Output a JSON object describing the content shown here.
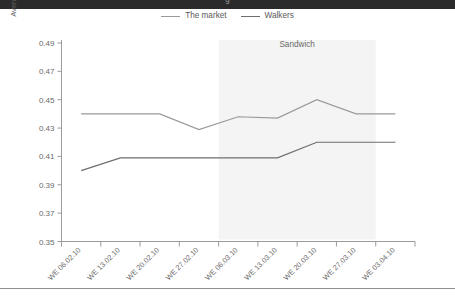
{
  "top_band": {
    "caption_fragment": "g"
  },
  "legend": {
    "position": "top-center",
    "entries": [
      {
        "label": "The market",
        "color": "#9a9a9a",
        "icon": "line-swatch-icon"
      },
      {
        "label": "Walkers",
        "color": "#6e6e6e",
        "icon": "line-swatch-icon"
      }
    ]
  },
  "annotations": [
    {
      "label": "Sandwich",
      "x_from": "WE 06.03.10",
      "x_to": "WE 27.03.10",
      "band_color": "#f4f4f4"
    }
  ],
  "axes": {
    "y_title": "Average price per single pack unit (£)",
    "y_ticks": [
      "0.35",
      "0.37",
      "0.39",
      "0.41",
      "0.43",
      "0.45",
      "0.47",
      "0.49"
    ],
    "x_ticks": [
      "WE 06.02.10",
      "WE 13.02.10",
      "WE 20.02.10",
      "WE 27.02.10",
      "WE 06.03.10",
      "WE 13.03.10",
      "WE 20.03.10",
      "WE 27.03.10",
      "WE 03.04.10"
    ]
  },
  "chart_data": {
    "type": "line",
    "title": "",
    "subtitle": "",
    "xlabel": "",
    "ylabel": "Average price per single pack unit (£)",
    "ylim": [
      0.35,
      0.49
    ],
    "ytick_step": 0.02,
    "grid": false,
    "legend_position": "top-center",
    "categories": [
      "WE 06.02.10",
      "WE 13.02.10",
      "WE 20.02.10",
      "WE 27.02.10",
      "WE 06.03.10",
      "WE 13.03.10",
      "WE 20.03.10",
      "WE 27.03.10",
      "WE 03.04.10"
    ],
    "series": [
      {
        "name": "The market",
        "color": "#9a9a9a",
        "values": [
          0.44,
          0.44,
          0.44,
          0.429,
          0.438,
          0.437,
          0.45,
          0.44,
          0.44
        ]
      },
      {
        "name": "Walkers",
        "color": "#6e6e6e",
        "values": [
          0.4,
          0.409,
          0.409,
          0.409,
          0.409,
          0.409,
          0.42,
          0.42,
          0.42
        ]
      }
    ],
    "shaded_bands": [
      {
        "label": "Sandwich",
        "from_category": "WE 06.03.10",
        "to_category": "WE 27.03.10",
        "color": "#f4f4f4"
      }
    ]
  }
}
